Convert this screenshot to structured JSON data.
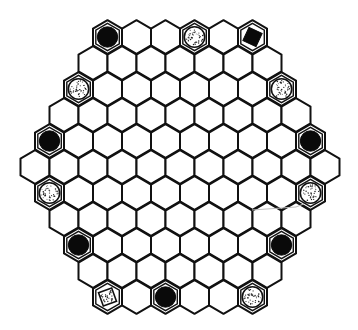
{
  "board": {
    "shape": "hexagonal hex-grid, side 6",
    "row_counts": [
      6,
      7,
      8,
      9,
      10,
      11,
      10,
      9,
      8,
      7,
      6
    ],
    "center_x": 180,
    "first_row_y": 37,
    "row_spacing": 26,
    "hex_width": 29,
    "hex_radius": 16.8,
    "colors": {
      "line": "#111111",
      "background": "#ffffff",
      "black_piece": "#0a0a0a",
      "dot": "#222222",
      "artifact_line": "#bdbdbd"
    }
  },
  "pieces": [
    {
      "row": 0,
      "col": 0,
      "type": "black-circle"
    },
    {
      "row": 0,
      "col": 3,
      "type": "dotted-circle"
    },
    {
      "row": 0,
      "col": 5,
      "type": "black-square"
    },
    {
      "row": 2,
      "col": 0,
      "type": "dotted-circle"
    },
    {
      "row": 2,
      "col": 7,
      "type": "dotted-circle"
    },
    {
      "row": 4,
      "col": 0,
      "type": "black-circle"
    },
    {
      "row": 4,
      "col": 9,
      "type": "black-circle"
    },
    {
      "row": 6,
      "col": 0,
      "type": "dotted-circle"
    },
    {
      "row": 6,
      "col": 9,
      "type": "dotted-circle"
    },
    {
      "row": 8,
      "col": 0,
      "type": "black-circle"
    },
    {
      "row": 8,
      "col": 7,
      "type": "black-circle"
    },
    {
      "row": 10,
      "col": 0,
      "type": "dotted-square"
    },
    {
      "row": 10,
      "col": 2,
      "type": "black-circle"
    },
    {
      "row": 10,
      "col": 5,
      "type": "dotted-circle"
    }
  ],
  "artifact_line": {
    "points": [
      [
        252,
        210
      ],
      [
        296,
        207
      ],
      [
        306,
        203
      ]
    ]
  }
}
